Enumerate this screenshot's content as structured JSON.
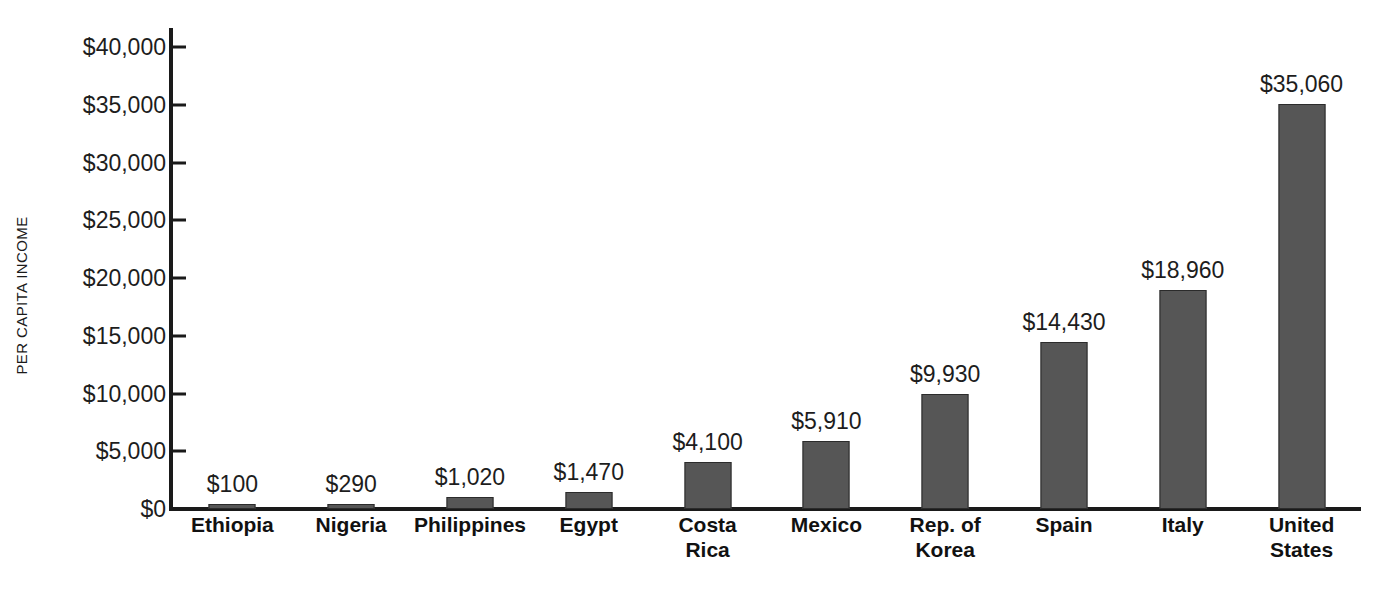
{
  "chart_data": {
    "type": "bar",
    "title": "",
    "xlabel": "",
    "ylabel": "PER CAPITA INCOME",
    "ylim": [
      0,
      40000
    ],
    "ytick_values": [
      0,
      5000,
      10000,
      15000,
      20000,
      25000,
      30000,
      35000,
      40000
    ],
    "ytick_labels": [
      "$0",
      "$5,000",
      "$10,000",
      "$15,000",
      "$20,000",
      "$25,000",
      "$30,000",
      "$35,000",
      "$40,000"
    ],
    "grid": false,
    "legend": false,
    "bar_color": "#565656",
    "bar_edge_color": "#2b2b2b",
    "axis_color": "#1a1a1a",
    "categories": [
      "Ethiopia",
      "Nigeria",
      "Philippines",
      "Egypt",
      "Costa Rica",
      "Mexico",
      "Rep. of Korea",
      "Spain",
      "Italy",
      "United States"
    ],
    "category_lines": [
      [
        "Ethiopia"
      ],
      [
        "Nigeria"
      ],
      [
        "Philippines"
      ],
      [
        "Egypt"
      ],
      [
        "Costa",
        "Rica"
      ],
      [
        "Mexico"
      ],
      [
        "Rep. of",
        "Korea"
      ],
      [
        "Spain"
      ],
      [
        "Italy"
      ],
      [
        "United",
        "States"
      ]
    ],
    "values": [
      100,
      290,
      1020,
      1470,
      4100,
      5910,
      9930,
      14430,
      18960,
      35060
    ],
    "value_labels": [
      "$100",
      "$290",
      "$1,020",
      "$1,470",
      "$4,100",
      "$5,910",
      "$9,930",
      "$14,430",
      "$18,960",
      "$35,060"
    ]
  }
}
